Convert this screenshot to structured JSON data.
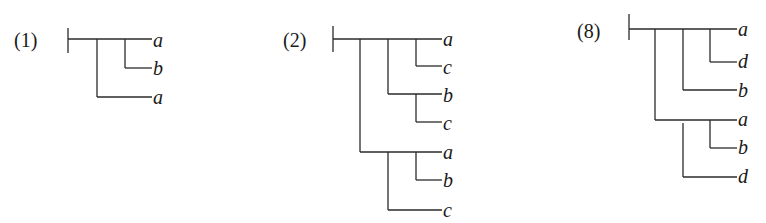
{
  "diagrams": [
    {
      "label": "(1)",
      "leaves": [
        "a",
        "b",
        "a"
      ]
    },
    {
      "label": "(2)",
      "leaves": [
        "a",
        "c",
        "b",
        "c",
        "a",
        "b",
        "c"
      ]
    },
    {
      "label": "(8)",
      "leaves": [
        "a",
        "d",
        "b",
        "a",
        "b",
        "d"
      ]
    }
  ]
}
